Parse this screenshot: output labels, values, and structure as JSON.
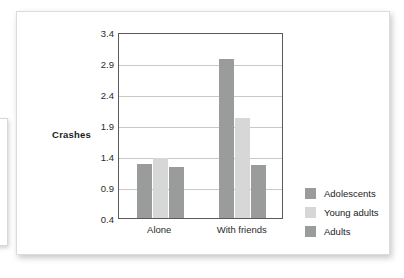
{
  "chart_data": {
    "type": "bar",
    "title": "",
    "subtitle": "",
    "xlabel": "",
    "ylabel": "Crashes",
    "categories": [
      "Alone",
      "With friends"
    ],
    "series": [
      {
        "name": "Adolescents",
        "color": "#9a9b9b",
        "values": [
          1.27,
          2.97
        ]
      },
      {
        "name": "Young adults",
        "color": "#d7d7d7",
        "values": [
          1.36,
          2.02
        ]
      },
      {
        "name": "Adults",
        "color": "#9a9b9b",
        "values": [
          1.22,
          1.25
        ]
      }
    ],
    "ylim": [
      0.4,
      3.4
    ],
    "yticks": [
      "0.4",
      "0.9",
      "1.4",
      "1.9",
      "2.4",
      "2.9",
      "3.4"
    ],
    "ytick_values": [
      0.4,
      0.9,
      1.4,
      1.9,
      2.4,
      2.9,
      3.4
    ],
    "grid": "horizontal",
    "legend_position": "right",
    "plot_border_color": "#5a5a5a",
    "gridline_color": "#c9c9c9",
    "background_color": "#ffffff"
  },
  "legend": {
    "items": [
      {
        "label": "Adolescents",
        "color": "#9a9b9b"
      },
      {
        "label": "Young adults",
        "color": "#d7d7d7"
      },
      {
        "label": "Adults",
        "color": "#9a9b9b"
      }
    ]
  }
}
